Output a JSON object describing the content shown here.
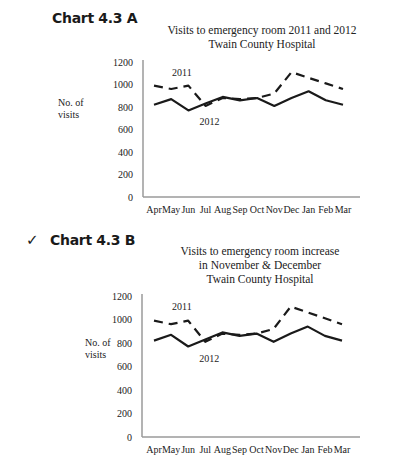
{
  "chart_data": [
    {
      "id": "A",
      "type": "line",
      "heading": "Chart 4.3 A",
      "checked": false,
      "title_lines": [
        "Visits to emergency room 2011 and 2012",
        "Twain County Hospital"
      ],
      "ylabel_lines": [
        "No. of",
        "visits"
      ],
      "xlabel": "",
      "ylim": [
        0,
        1200
      ],
      "yticks": [
        "0",
        "200",
        "400",
        "600",
        "800",
        "1000",
        "1200"
      ],
      "ytick_values": [
        0,
        200,
        400,
        600,
        800,
        1000,
        1200
      ],
      "categories": [
        "Apr",
        "May",
        "Jun",
        "Jul",
        "Aug",
        "Sep",
        "Oct",
        "Nov",
        "Dec",
        "Jan",
        "Feb",
        "Mar"
      ],
      "grid": false,
      "series": [
        {
          "name": "2011",
          "style": "dashed",
          "values": [
            990,
            960,
            990,
            810,
            880,
            870,
            880,
            920,
            1110,
            1060,
            1010,
            960
          ]
        },
        {
          "name": "2012",
          "style": "solid",
          "values": [
            820,
            870,
            770,
            830,
            890,
            860,
            880,
            810,
            880,
            940,
            860,
            820
          ]
        }
      ],
      "annotations": [
        {
          "text": "2011",
          "series": "2011"
        },
        {
          "text": "2012",
          "series": "2012"
        }
      ]
    },
    {
      "id": "B",
      "type": "line",
      "heading": "Chart 4.3 B",
      "checked": true,
      "check_mark": "✓",
      "title_lines": [
        "Visits to emergency room increase",
        "in November & December",
        "Twain County Hospital"
      ],
      "ylabel_lines": [
        "No. of",
        "visits"
      ],
      "xlabel": "",
      "ylim": [
        0,
        1200
      ],
      "yticks": [
        "0",
        "200",
        "400",
        "600",
        "800",
        "1000",
        "1200"
      ],
      "ytick_values": [
        0,
        200,
        400,
        600,
        800,
        1000,
        1200
      ],
      "categories": [
        "Apr",
        "May",
        "Jun",
        "Jul",
        "Aug",
        "Sep",
        "Oct",
        "Nov",
        "Dec",
        "Jan",
        "Feb",
        "Mar"
      ],
      "grid": false,
      "series": [
        {
          "name": "2011",
          "style": "dashed",
          "values": [
            990,
            960,
            990,
            810,
            880,
            870,
            880,
            920,
            1110,
            1060,
            1010,
            960
          ]
        },
        {
          "name": "2012",
          "style": "solid",
          "values": [
            820,
            870,
            770,
            830,
            890,
            860,
            880,
            810,
            880,
            940,
            860,
            820
          ]
        }
      ],
      "annotations": [
        {
          "text": "2011",
          "series": "2011"
        },
        {
          "text": "2012",
          "series": "2012"
        }
      ]
    }
  ],
  "colors": {
    "line": "#1a1a1a",
    "axis": "#9a9a9a",
    "text": "#222222"
  }
}
